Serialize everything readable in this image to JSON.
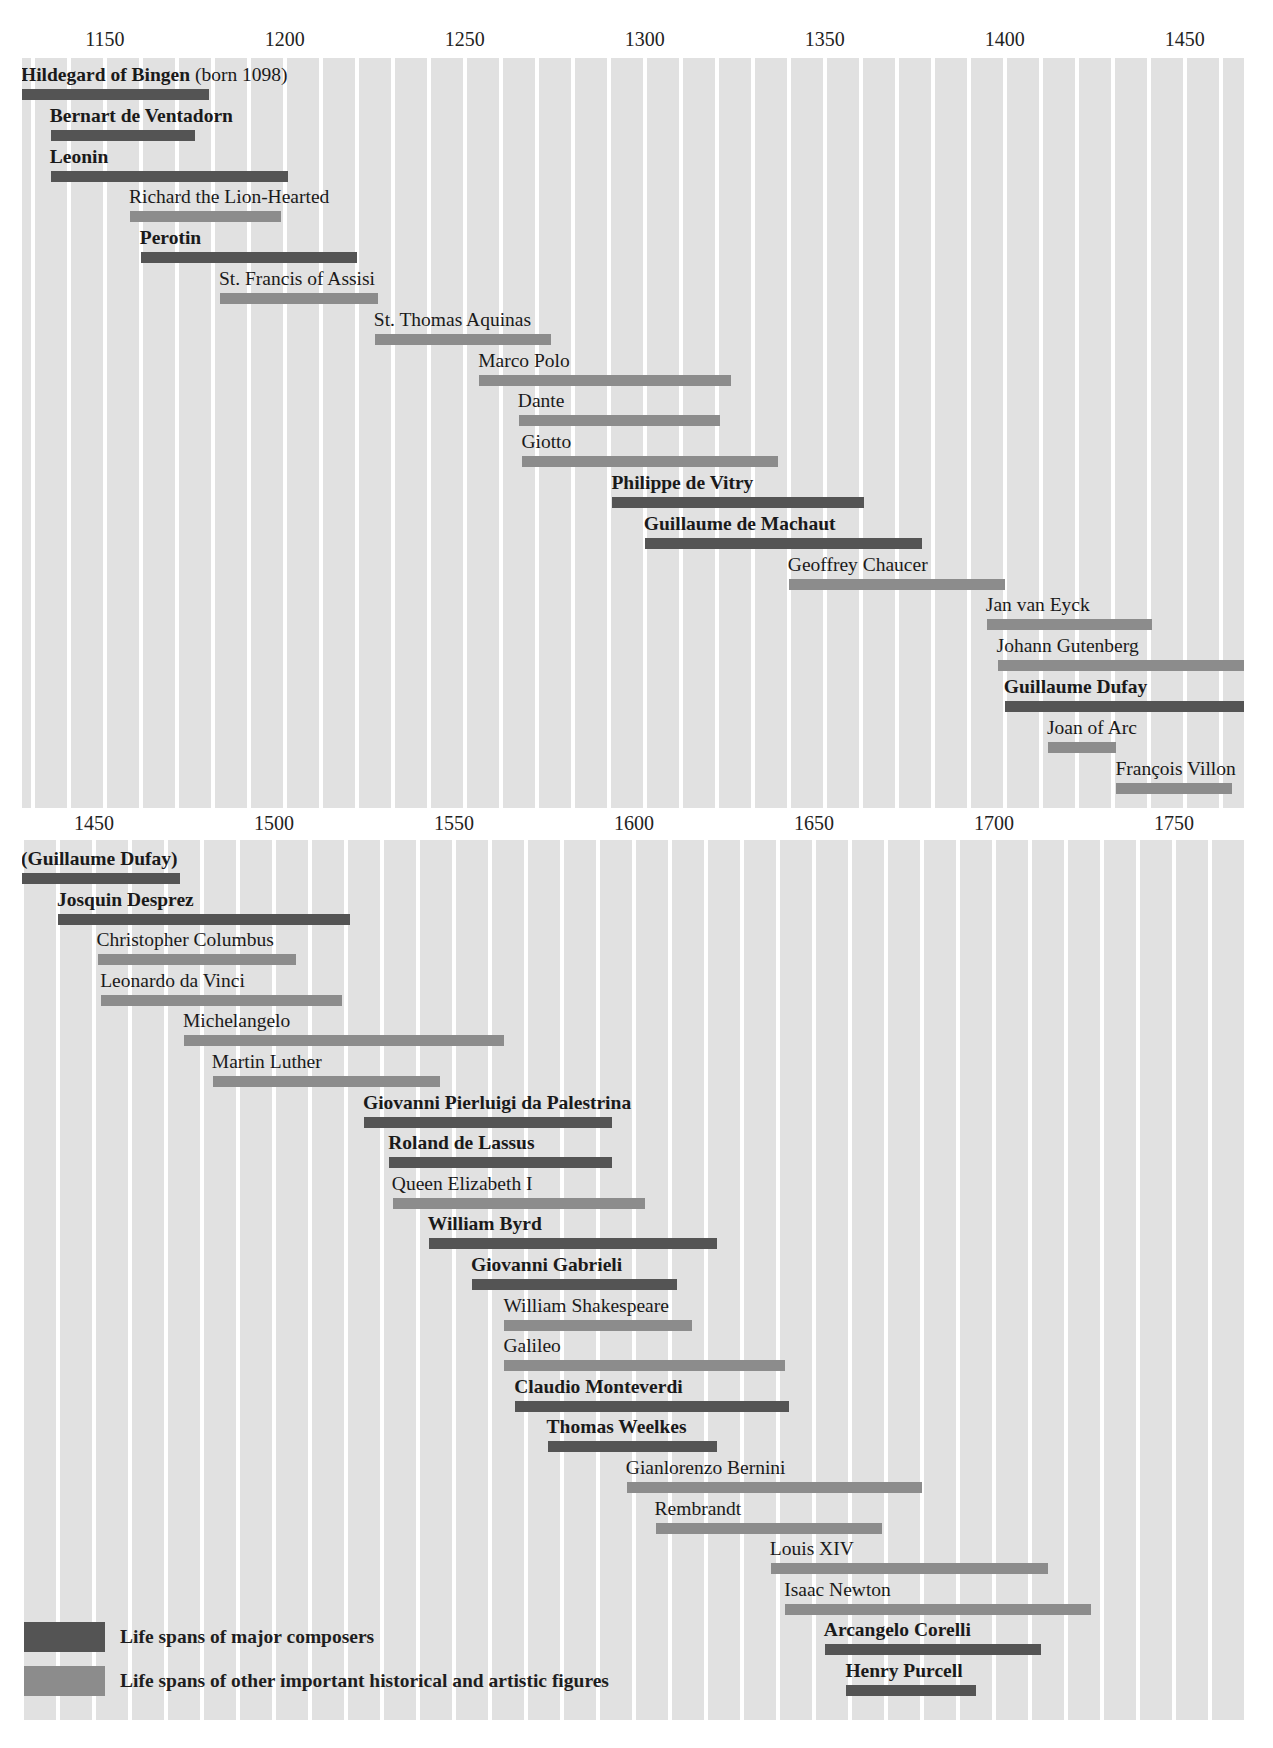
{
  "chart_data": [
    {
      "type": "timeline",
      "title": "",
      "xlabel": "Year",
      "xlim": [
        1127,
        1467
      ],
      "ticks": [
        "1150",
        "1200",
        "1250",
        "1300",
        "1350",
        "1400",
        "1450"
      ],
      "tick_values": [
        1150,
        1200,
        1250,
        1300,
        1350,
        1400,
        1450
      ],
      "grid": "vertical bands every 10 years",
      "rows": [
        {
          "name": "Hildegard of Bingen",
          "suffix": " (born 1098)",
          "start": 1098,
          "end": 1179,
          "kind": "composer"
        },
        {
          "name": "Bernart de Ventadorn",
          "suffix": "",
          "start": 1135,
          "end": 1175,
          "kind": "composer"
        },
        {
          "name": "Leonin",
          "suffix": "",
          "start": 1135,
          "end": 1201,
          "kind": "composer"
        },
        {
          "name": "Richard the Lion-Hearted",
          "suffix": "",
          "start": 1157,
          "end": 1199,
          "kind": "other"
        },
        {
          "name": "Perotin",
          "suffix": "",
          "start": 1160,
          "end": 1220,
          "kind": "composer"
        },
        {
          "name": "St. Francis of Assisi",
          "suffix": "",
          "start": 1182,
          "end": 1226,
          "kind": "other"
        },
        {
          "name": "St. Thomas Aquinas",
          "suffix": "",
          "start": 1225,
          "end": 1274,
          "kind": "other"
        },
        {
          "name": "Marco Polo",
          "suffix": "",
          "start": 1254,
          "end": 1324,
          "kind": "other"
        },
        {
          "name": "Dante",
          "suffix": "",
          "start": 1265,
          "end": 1321,
          "kind": "other"
        },
        {
          "name": "Giotto",
          "suffix": "",
          "start": 1266,
          "end": 1337,
          "kind": "other"
        },
        {
          "name": "Philippe de Vitry",
          "suffix": "",
          "start": 1291,
          "end": 1361,
          "kind": "composer"
        },
        {
          "name": "Guillaume de Machaut",
          "suffix": "",
          "start": 1300,
          "end": 1377,
          "kind": "composer"
        },
        {
          "name": "Geoffrey Chaucer",
          "suffix": "",
          "start": 1340,
          "end": 1400,
          "kind": "other"
        },
        {
          "name": "Jan van Eyck",
          "suffix": "",
          "start": 1395,
          "end": 1441,
          "kind": "other"
        },
        {
          "name": "Johann Gutenberg",
          "suffix": "",
          "start": 1398,
          "end": 1468,
          "kind": "other"
        },
        {
          "name": "Guillaume Dufay",
          "suffix": "",
          "start": 1400,
          "end": 1474,
          "kind": "composer"
        },
        {
          "name": "Joan of Arc",
          "suffix": "",
          "start": 1412,
          "end": 1431,
          "kind": "other"
        },
        {
          "name": "François Villon",
          "suffix": "",
          "start": 1431,
          "end": 1463,
          "kind": "other"
        }
      ]
    },
    {
      "type": "timeline",
      "title": "",
      "xlabel": "Year",
      "xlim": [
        1430,
        1770
      ],
      "ticks": [
        "1450",
        "1500",
        "1550",
        "1600",
        "1650",
        "1700",
        "1750"
      ],
      "tick_values": [
        1450,
        1500,
        1550,
        1600,
        1650,
        1700,
        1750
      ],
      "grid": "vertical bands every 10 years",
      "rows": [
        {
          "name": "(Guillaume Dufay)",
          "suffix": "",
          "start": 1400,
          "end": 1474,
          "kind": "composer"
        },
        {
          "name": "Josquin Desprez",
          "suffix": "",
          "start": 1440,
          "end": 1521,
          "kind": "composer"
        },
        {
          "name": "Christopher Columbus",
          "suffix": "",
          "start": 1451,
          "end": 1506,
          "kind": "other"
        },
        {
          "name": "Leonardo da Vinci",
          "suffix": "",
          "start": 1452,
          "end": 1519,
          "kind": "other"
        },
        {
          "name": "Michelangelo",
          "suffix": "",
          "start": 1475,
          "end": 1564,
          "kind": "other"
        },
        {
          "name": "Martin Luther",
          "suffix": "",
          "start": 1483,
          "end": 1546,
          "kind": "other"
        },
        {
          "name": "Giovanni Pierluigi da Palestrina",
          "suffix": "",
          "start": 1525,
          "end": 1594,
          "kind": "composer"
        },
        {
          "name": "Roland de Lassus",
          "suffix": "",
          "start": 1532,
          "end": 1594,
          "kind": "composer"
        },
        {
          "name": "Queen Elizabeth I",
          "suffix": "",
          "start": 1533,
          "end": 1603,
          "kind": "other"
        },
        {
          "name": "William Byrd",
          "suffix": "",
          "start": 1543,
          "end": 1623,
          "kind": "composer"
        },
        {
          "name": "Giovanni Gabrieli",
          "suffix": "",
          "start": 1555,
          "end": 1612,
          "kind": "composer"
        },
        {
          "name": "William Shakespeare",
          "suffix": "",
          "start": 1564,
          "end": 1616,
          "kind": "other"
        },
        {
          "name": "Galileo",
          "suffix": "",
          "start": 1564,
          "end": 1642,
          "kind": "other"
        },
        {
          "name": "Claudio Monteverdi",
          "suffix": "",
          "start": 1567,
          "end": 1643,
          "kind": "composer"
        },
        {
          "name": "Thomas Weelkes",
          "suffix": "",
          "start": 1576,
          "end": 1623,
          "kind": "composer"
        },
        {
          "name": "Gianlorenzo Bernini",
          "suffix": "",
          "start": 1598,
          "end": 1680,
          "kind": "other"
        },
        {
          "name": "Rembrandt",
          "suffix": "",
          "start": 1606,
          "end": 1669,
          "kind": "other"
        },
        {
          "name": "Louis XIV",
          "suffix": "",
          "start": 1638,
          "end": 1715,
          "kind": "other"
        },
        {
          "name": "Isaac Newton",
          "suffix": "",
          "start": 1642,
          "end": 1727,
          "kind": "other"
        },
        {
          "name": "Arcangelo Corelli",
          "suffix": "",
          "start": 1653,
          "end": 1713,
          "kind": "composer"
        },
        {
          "name": "Henry Purcell",
          "suffix": "",
          "start": 1659,
          "end": 1695,
          "kind": "composer"
        }
      ]
    }
  ],
  "legend": {
    "composer_label": "Life spans of major composers",
    "other_label": "Life spans of other important historical and artistic figures"
  },
  "colors": {
    "composer": "#545454",
    "other": "#8c8c8c",
    "band": "#e1e1e1",
    "background": "#ffffff"
  }
}
